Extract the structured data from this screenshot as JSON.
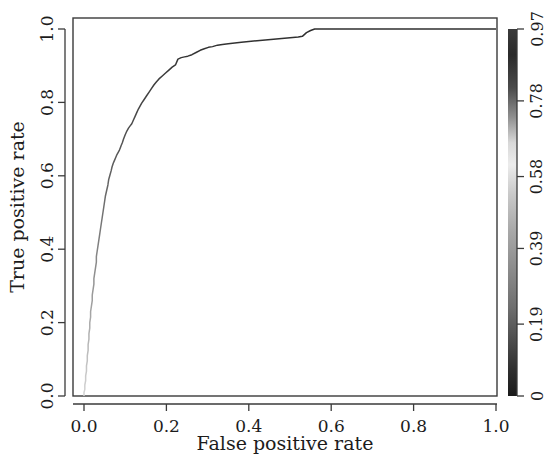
{
  "chart_data": {
    "type": "line",
    "title": "",
    "subtitle": "",
    "xlabel": "False positive rate",
    "ylabel": "True positive rate",
    "xlim": [
      0,
      1
    ],
    "ylim": [
      0,
      1
    ],
    "grid": false,
    "legend": "none",
    "x_ticks": [
      "0.0",
      "0.2",
      "0.4",
      "0.6",
      "0.8",
      "1.0"
    ],
    "x_tick_values": [
      0.0,
      0.2,
      0.4,
      0.6,
      0.8,
      1.0
    ],
    "y_ticks": [
      "0.0",
      "0.2",
      "0.4",
      "0.6",
      "0.8",
      "1.0"
    ],
    "y_tick_values": [
      0.0,
      0.2,
      0.4,
      0.6,
      0.8,
      1.0
    ],
    "series": [
      {
        "name": "ROC curve",
        "description": "Receiver operating characteristic curve, colored by classification threshold",
        "x": [
          0.0,
          0.0,
          0.002,
          0.002,
          0.004,
          0.004,
          0.006,
          0.006,
          0.008,
          0.008,
          0.01,
          0.01,
          0.012,
          0.012,
          0.014,
          0.014,
          0.016,
          0.016,
          0.018,
          0.02,
          0.02,
          0.022,
          0.024,
          0.024,
          0.026,
          0.028,
          0.03,
          0.03,
          0.032,
          0.034,
          0.036,
          0.038,
          0.04,
          0.042,
          0.044,
          0.046,
          0.048,
          0.05,
          0.052,
          0.055,
          0.058,
          0.06,
          0.063,
          0.066,
          0.068,
          0.071,
          0.074,
          0.077,
          0.08,
          0.083,
          0.086,
          0.088,
          0.09,
          0.093,
          0.096,
          0.1,
          0.104,
          0.108,
          0.112,
          0.116,
          0.12,
          0.124,
          0.128,
          0.132,
          0.136,
          0.14,
          0.146,
          0.152,
          0.158,
          0.164,
          0.17,
          0.176,
          0.182,
          0.19,
          0.198,
          0.206,
          0.214,
          0.222,
          0.228,
          0.236,
          0.244,
          0.252,
          0.262,
          0.272,
          0.282,
          0.292,
          0.302,
          0.312,
          0.324,
          0.336,
          0.35,
          0.366,
          0.382,
          0.4,
          0.42,
          0.44,
          0.46,
          0.48,
          0.5,
          0.52,
          0.53,
          0.54,
          0.55,
          0.56,
          0.7,
          0.85,
          1.0
        ],
        "y": [
          0.0,
          0.01,
          0.018,
          0.03,
          0.042,
          0.055,
          0.068,
          0.082,
          0.096,
          0.11,
          0.124,
          0.14,
          0.155,
          0.17,
          0.185,
          0.2,
          0.215,
          0.23,
          0.245,
          0.26,
          0.275,
          0.29,
          0.305,
          0.32,
          0.335,
          0.35,
          0.365,
          0.38,
          0.395,
          0.41,
          0.425,
          0.44,
          0.455,
          0.47,
          0.485,
          0.5,
          0.515,
          0.53,
          0.545,
          0.56,
          0.575,
          0.59,
          0.602,
          0.614,
          0.624,
          0.634,
          0.642,
          0.65,
          0.658,
          0.664,
          0.67,
          0.676,
          0.682,
          0.69,
          0.7,
          0.712,
          0.722,
          0.73,
          0.736,
          0.742,
          0.752,
          0.762,
          0.772,
          0.782,
          0.79,
          0.798,
          0.808,
          0.818,
          0.828,
          0.838,
          0.848,
          0.856,
          0.864,
          0.872,
          0.88,
          0.888,
          0.896,
          0.902,
          0.918,
          0.922,
          0.924,
          0.926,
          0.93,
          0.936,
          0.942,
          0.946,
          0.95,
          0.952,
          0.956,
          0.958,
          0.96,
          0.962,
          0.964,
          0.966,
          0.968,
          0.97,
          0.972,
          0.974,
          0.976,
          0.978,
          0.98,
          0.99,
          0.996,
          1.0,
          1.0,
          1.0,
          1.0
        ]
      }
    ],
    "colorbar": {
      "position": "right",
      "label": "",
      "tick_labels": [
        "0.97",
        "0.78",
        "0.58",
        "0.39",
        "0.19",
        "0"
      ],
      "tick_values": [
        0.97,
        0.78,
        0.58,
        0.39,
        0.19,
        0
      ],
      "gradient_stops": [
        {
          "pos": 0.0,
          "color": "#3b3b3b"
        },
        {
          "pos": 0.07,
          "color": "#2a2a2a"
        },
        {
          "pos": 0.16,
          "color": "#4a4a4a"
        },
        {
          "pos": 0.24,
          "color": "#8f8f8f"
        },
        {
          "pos": 0.31,
          "color": "#d8d8d8"
        },
        {
          "pos": 0.37,
          "color": "#ececec"
        },
        {
          "pos": 0.45,
          "color": "#c9c9c9"
        },
        {
          "pos": 0.55,
          "color": "#a8a8a8"
        },
        {
          "pos": 0.66,
          "color": "#8a8a8a"
        },
        {
          "pos": 0.76,
          "color": "#6e6e6e"
        },
        {
          "pos": 0.85,
          "color": "#4c4c4c"
        },
        {
          "pos": 0.93,
          "color": "#2e2e2e"
        },
        {
          "pos": 1.0,
          "color": "#1a1a1a"
        }
      ]
    },
    "colors": {
      "axis": "#3a3a3a",
      "text": "#1c1c1c",
      "background": "#ffffff"
    }
  }
}
